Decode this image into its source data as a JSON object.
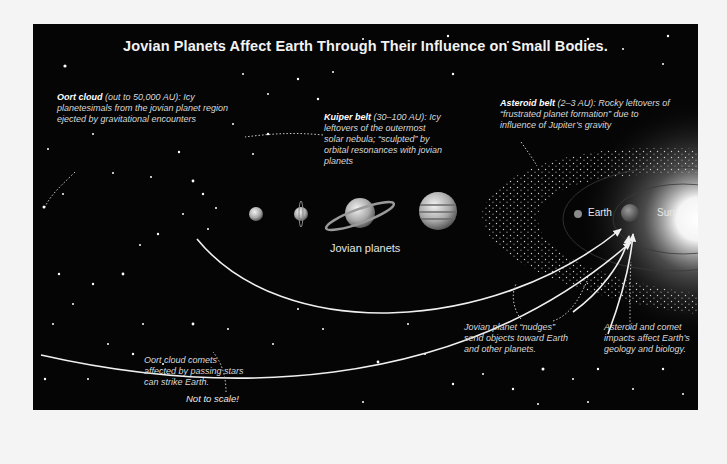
{
  "title": "Jovian Planets Affect Earth Through Their Influence on Small Bodies.",
  "annotations": {
    "oort_cloud": {
      "heading": "Oort cloud",
      "range": "(out to 50,000 AU):",
      "text": "Icy planetesimals from the jovian planet region ejected by gravitational encounters"
    },
    "kuiper_belt": {
      "heading": "Kuiper belt",
      "range": "(30–100 AU):",
      "text": "Icy leftovers of the outermost solar nebula; “sculpted” by orbital resonances with jovian planets"
    },
    "asteroid_belt": {
      "heading": "Asteroid belt",
      "range": "(2–3 AU):",
      "text": "Rocky leftovers of “frustrated planet formation” due to influence of Jupiter’s gravity"
    },
    "oort_comets": "Oort cloud comets affected by passing stars can strike Earth.",
    "jovian_nudges": "Jovian planet “nudges” send objects toward Earth and other planets.",
    "impacts": "Asteroid and comet impacts affect Earth’s geology and biology.",
    "scale_note": "Not to scale!"
  },
  "labels": {
    "jovian_planets": "Jovian planets",
    "earth": "Earth",
    "sun": "Sun"
  },
  "planets": [
    "Neptune",
    "Uranus",
    "Saturn",
    "Jupiter",
    "Mars",
    "Earth",
    "Sun"
  ],
  "colors": {
    "background": "#050505",
    "frame": "#f4f4f4",
    "text": "#d8d8d8",
    "arrow": "#f0f0f0"
  }
}
